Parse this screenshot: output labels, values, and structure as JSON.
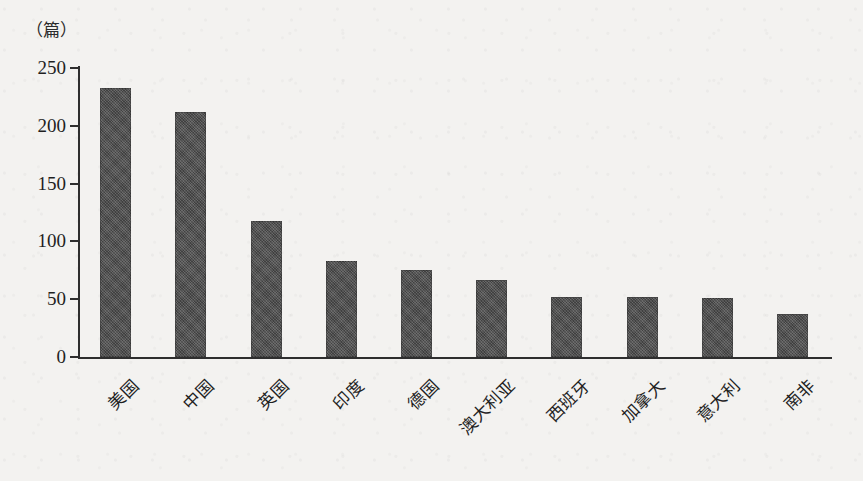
{
  "chart_data": {
    "type": "bar",
    "title": "",
    "subtitle": "",
    "unit_label": "（篇）",
    "xlabel": "",
    "ylabel": "",
    "ylim": [
      0,
      250
    ],
    "yticks": [
      0,
      50,
      100,
      150,
      200,
      250
    ],
    "ytick_labels": [
      "0",
      "50",
      "100",
      "150",
      "200",
      "250"
    ],
    "grid": false,
    "legend": false,
    "legend_position": "none",
    "bar_color": "#4d4d4d",
    "axis_color": "#2e2e2e",
    "background_color": "#f3f2f0",
    "categories": [
      "美国",
      "中国",
      "英国",
      "印度",
      "德国",
      "澳大利亚",
      "西班牙",
      "加拿大",
      "意大利",
      "南非"
    ],
    "values": [
      233,
      212,
      118,
      83,
      75,
      67,
      52,
      52,
      51,
      37
    ],
    "annotations": []
  }
}
